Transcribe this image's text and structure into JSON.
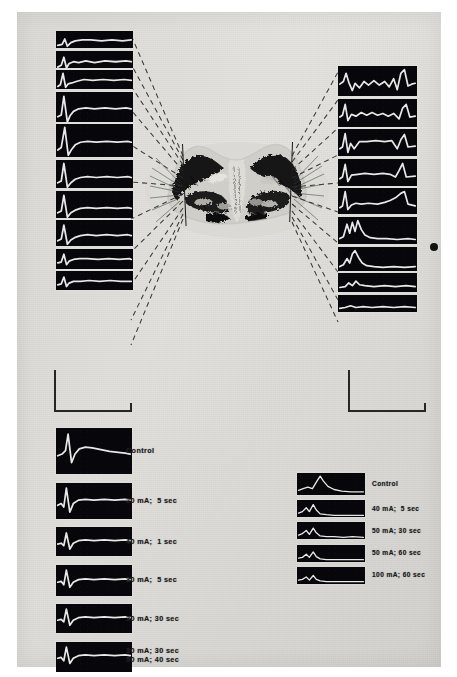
{
  "figure": {
    "kind": "scientific-plate",
    "plate_background_color": "#e3e2de",
    "trace_color": "#e8e8e8",
    "strip_background_color": "#07060a",
    "ink_color": "#1b1b1b"
  },
  "left_column": {
    "name": "left-depth-series",
    "strip_count": 10,
    "strips": [
      {
        "id": "L1",
        "path": "M2,16 L7,15 L10,9 L13,17 L17,13 L22,11 L30,10 L40,10 L52,11 L64,10 L76,11 L86,10"
      },
      {
        "id": "L2",
        "path": "M2,18 L6,16 L9,7 L12,19 L15,14 L20,12 L26,13 L34,11 L44,13 L56,11 L68,12 L80,11 L86,12"
      },
      {
        "id": "L3",
        "path": "M2,19 L5,17 L8,4 L11,20 L14,16 L18,15 L24,13 L32,11 L42,12 L54,11 L66,12 L78,11 L86,12"
      },
      {
        "id": "L4",
        "path": "M2,28 L6,26 L9,5 L13,34 L16,27 L20,22 L26,19 L34,18 L44,19 L56,18 L68,19 L80,18 L86,19"
      },
      {
        "id": "L5",
        "path": "M2,30 L6,27 L10,4 L14,36 L18,29 L22,24 L28,21 L36,20 L46,21 L58,20 L70,21 L82,20 L86,21"
      },
      {
        "id": "L6",
        "path": "M2,26 L6,24 L9,4 L13,31 L17,26 L22,22 L28,20 L36,19 L46,20 L58,19 L70,20 L82,19 L86,20"
      },
      {
        "id": "L7",
        "path": "M2,25 L6,23 L9,5 L13,30 L17,25 L22,22 L28,20 L36,19 L46,20 L58,19 L70,20 L82,19 L86,20"
      },
      {
        "id": "L8",
        "path": "M2,24 L6,22 L9,6 L13,28 L17,23 L22,20 L28,18 L36,17 L46,18 L58,17 L70,18 L82,17 L86,18"
      },
      {
        "id": "L9",
        "path": "M2,16 L6,15 L9,6 L12,18 L15,14 L20,12 L27,11 L36,11 L48,12 L60,11 L72,12 L84,11 L86,12"
      },
      {
        "id": "L10",
        "path": "M2,16 L6,15 L9,7 L12,18 L15,14 L20,12 L28,12 L38,11 L50,12 L62,11 L74,12 L86,12"
      }
    ]
  },
  "right_column": {
    "name": "right-depth-series",
    "strip_count": 9,
    "strips": [
      {
        "id": "R1",
        "path": "M2,20 L6,17 L9,8 L12,18 L16,27 L19,19 L24,24 L29,17 L34,21 L40,16 L46,21 L52,17 L57,23 L62,14 L66,26 L70,8 L74,4 L78,22 L82,20 L86,19"
      },
      {
        "id": "R2",
        "path": "M2,20 L5,18 L8,6 L11,24 L15,17 L20,19 L26,15 L32,18 L38,15 L44,18 L50,16 L56,19 L62,16 L68,22 L72,10 L76,6 L80,20 L86,19"
      },
      {
        "id": "R3",
        "path": "M2,22 L5,20 L8,5 L11,26 L14,16 L18,22 L24,14 L32,14 L42,13 L52,14 L60,13 L66,22 L70,12 L74,6 L78,20 L86,19"
      },
      {
        "id": "R4",
        "path": "M2,22 L5,20 L8,6 L11,25 L15,18 L22,17 L30,16 L40,17 L50,16 L58,17 L64,20 L68,13 L72,5 L76,20 L86,19"
      },
      {
        "id": "R5",
        "path": "M2,22 L5,20 L8,4 L11,24 L15,19 L20,17 L26,18 L34,17 L44,18 L52,16 L58,14 L64,11 L70,6 L74,4 L78,18 L86,20"
      },
      {
        "id": "R6",
        "path": "M2,24 L6,22 L10,8 L13,18 L16,6 L19,16 L22,4 L26,14 L30,20 L36,23 L44,24 L54,24 L66,25 L78,24 L86,25"
      },
      {
        "id": "R7",
        "path": "M2,22 L6,20 L10,13 L13,18 L16,8 L19,4 L23,12 L27,18 L32,21 L40,22 L50,23 L62,22 L74,23 L86,22"
      },
      {
        "id": "R8",
        "path": "M2,16 L8,15 L12,11 L16,14 L20,9 L24,13 L30,14 L40,15 L52,14 L64,15 L76,14 L86,15"
      },
      {
        "id": "R9",
        "path": "M2,15 L8,14 L14,12 L20,14 L28,13 L38,14 L50,13 L62,14 L74,13 L86,14"
      }
    ]
  },
  "bottom_left_series": {
    "name": "bottom-left-stimulation-series",
    "rows": [
      {
        "label": "Control",
        "path": "M2,32 L7,30 L11,26 L14,7  L18,40 L22,30 L27,24 L34,22 L42,23 L52,25 L62,27 L72,28 L80,29 L86,30"
      },
      {
        "label": "20 mA;  5 sec",
        "path": "M2,26 L6,24 L9,28 L12,6  L16,34 L20,24 L26,20 L34,19 L44,20 L56,19 L68,20 L80,19 L86,20"
      },
      {
        "label": "40 mA;  1 sec",
        "path": "M2,20 L6,19 L9,22 L12,7  L16,26 L20,19 L26,16 L34,15 L44,16 L56,15 L68,16 L80,15 L86,16"
      },
      {
        "label": "30 mA;  5 sec",
        "path": "M2,20 L6,19 L9,23 L12,6  L16,26 L20,20 L26,17 L34,16 L44,17 L56,16 L68,17 L80,16 L86,17"
      },
      {
        "label": "30 mA; 30 sec",
        "path": "M2,19 L6,18 L9,21 L12,6  L16,25 L20,19 L26,16 L34,15 L44,16 L56,15 L68,16 L80,15 L86,16"
      },
      {
        "label": "30 mA; 30 sec\n50 mA; 40 sec",
        "path": "M2,19 L6,18 L9,22 L12,6  L16,25 L20,19 L26,16 L34,15 L44,16 L56,15 L68,16 L80,15 L86,16"
      }
    ]
  },
  "bottom_right_series": {
    "name": "bottom-right-stimulation-series",
    "rows": [
      {
        "label": "Control",
        "path": "M2,22 L8,20 L14,18 L20,20 L26,10 L30,4  L34,10 L40,17 L48,21 L58,23 L70,24 L82,24 L86,24"
      },
      {
        "label": "40 mA;  5 sec",
        "path": "M2,17 L7,15 L12,10 L16,15 L21,6  L25,13 L30,18 L38,19 L48,20 L60,20 L72,20 L86,20"
      },
      {
        "label": "50 mA; 30 sec",
        "path": "M2,17 L7,15 L12,11 L16,16 L21,8  L25,14 L30,18 L38,19 L48,19 L60,20 L72,19 L86,20"
      },
      {
        "label": "50 mA; 60 sec",
        "path": "M2,17 L7,16 L12,12 L16,16 L21,9  L25,15 L30,18 L38,19 L48,19 L60,19 L72,19 L86,19"
      },
      {
        "label": "100 mA; 60 sec",
        "path": "M2,17 L7,16 L12,13 L16,17 L21,11 L25,16 L30,18 L38,19 L48,19 L60,19 L72,19 L86,19"
      }
    ]
  },
  "calibration_markers": [
    {
      "id": "left-calibration-bracket"
    },
    {
      "id": "right-calibration-bracket"
    }
  ],
  "electrode_tracks": [
    {
      "id": "left-electrode-track"
    },
    {
      "id": "right-electrode-track"
    }
  ],
  "marker_dot": {
    "id": "reference-dot"
  }
}
